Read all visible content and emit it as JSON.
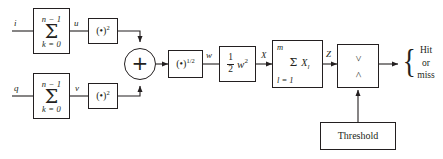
{
  "diagram": {
    "stroke_color": "#231f20",
    "background": "#ffffff",
    "inputs": {
      "i_label": "i",
      "q_label": "q"
    },
    "blocks": {
      "sum_i": {
        "top": "n − 1",
        "symbol": "Σ",
        "bottom": "k = 0"
      },
      "sum_q": {
        "top": "n − 1",
        "symbol": "Σ",
        "bottom": "k = 0"
      },
      "square_i": {
        "base": "(•)",
        "exponent": "2"
      },
      "square_q": {
        "base": "(•)",
        "exponent": "2"
      },
      "adder": {
        "symbol": "+"
      },
      "sqrt": {
        "base": "(•)",
        "exponent": "1/2"
      },
      "half_w_squared": {
        "numerator": "1",
        "denominator": "2",
        "variable": "w",
        "exponent": "2"
      },
      "sum_xl": {
        "top": "m",
        "symbol": "Σ",
        "term": "X",
        "term_sub": "l",
        "bottom": "l = 1"
      },
      "comparator": {
        "greater": ">",
        "less": "<"
      },
      "threshold": {
        "label": "Threshold"
      }
    },
    "signals": {
      "u": "u",
      "v": "v",
      "w": "w",
      "X": "X",
      "Z": "Z"
    },
    "output": {
      "brace": "{",
      "line1": "Hit",
      "line2": "or",
      "line3": "miss"
    }
  }
}
